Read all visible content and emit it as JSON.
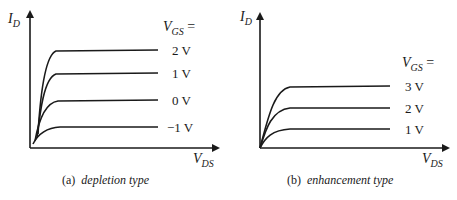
{
  "panels": [
    {
      "id": "a",
      "caption_prefix": "(a)",
      "caption_text": "depletion type",
      "y_axis_label_main": "I",
      "y_axis_label_sub": "D",
      "x_axis_label_main": "V",
      "x_axis_label_sub": "DS",
      "legend_title_main": "V",
      "legend_title_sub": "GS",
      "legend_title_suffix": " =",
      "curves": [
        {
          "label": "2 V",
          "vgs": 2
        },
        {
          "label": "1 V",
          "vgs": 1
        },
        {
          "label": "0 V",
          "vgs": 0
        },
        {
          "label": "−1 V",
          "vgs": -1
        }
      ]
    },
    {
      "id": "b",
      "caption_prefix": "(b)",
      "caption_text": "enhancement type",
      "y_axis_label_main": "I",
      "y_axis_label_sub": "D",
      "x_axis_label_main": "V",
      "x_axis_label_sub": "DS",
      "legend_title_main": "V",
      "legend_title_sub": "GS",
      "legend_title_suffix": " =",
      "curves": [
        {
          "label": "3 V",
          "vgs": 3
        },
        {
          "label": "2 V",
          "vgs": 2
        },
        {
          "label": "1 V",
          "vgs": 1
        }
      ]
    }
  ],
  "colors": {
    "ink": "#1a1a1a",
    "background": "#ffffff"
  }
}
